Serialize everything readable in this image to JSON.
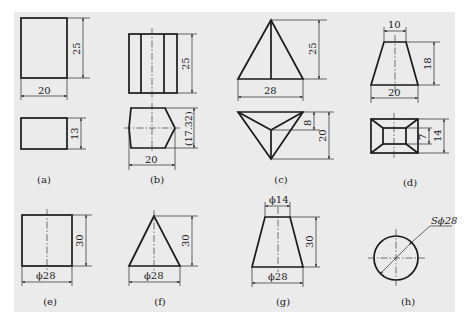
{
  "figure": {
    "background": "#ebebeb",
    "line_color": "#1a1a1a",
    "views": [
      {
        "label": "(a)",
        "shape": "rectangular prism",
        "dims": {
          "width": "20",
          "height": "25",
          "depth": "13"
        }
      },
      {
        "label": "(b)",
        "shape": "hexagonal prism",
        "dims": {
          "height": "25",
          "across_corners": "20",
          "across_flats": "(17.32)"
        }
      },
      {
        "label": "(c)",
        "shape": "triangular pyramid",
        "dims": {
          "base": "28",
          "height": "25",
          "apex_offset": "8",
          "depth": "20"
        }
      },
      {
        "label": "(d)",
        "shape": "truncated square pyramid",
        "dims": {
          "top": "10",
          "bottom": "20",
          "height": "18",
          "inner_depth": "7",
          "outer_depth": "14"
        }
      },
      {
        "label": "(e)",
        "shape": "cylinder",
        "dims": {
          "diameter": "ϕ28",
          "height": "30"
        }
      },
      {
        "label": "(f)",
        "shape": "cone",
        "dims": {
          "diameter": "ϕ28",
          "height": "30"
        }
      },
      {
        "label": "(g)",
        "shape": "truncated cone",
        "dims": {
          "top_diameter": "ϕ14",
          "bottom_diameter": "ϕ28",
          "height": "30"
        }
      },
      {
        "label": "(h)",
        "shape": "sphere",
        "dims": {
          "diameter": "Sϕ28"
        }
      }
    ]
  }
}
